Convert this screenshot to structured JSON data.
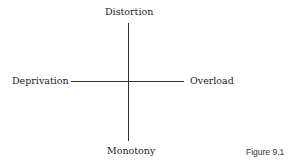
{
  "diagram": {
    "top": "Distortion",
    "left": "Deprivation",
    "right": "Overload",
    "bottom": "Monotony"
  },
  "caption": "Figure 9.1"
}
